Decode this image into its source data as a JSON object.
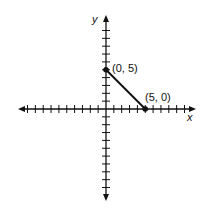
{
  "chart_data": {
    "type": "line",
    "title": "",
    "xlabel": "x",
    "ylabel": "y",
    "xlim": [
      -10,
      11
    ],
    "ylim": [
      -11,
      10
    ],
    "grid": false,
    "tick_interval": 1,
    "series": [
      {
        "name": "segment",
        "x": [
          0,
          5
        ],
        "y": [
          5,
          0
        ]
      }
    ],
    "points": [
      {
        "x": 0,
        "y": 5,
        "label": "(0, 5)"
      },
      {
        "x": 5,
        "y": 0,
        "label": "(5, 0)"
      }
    ]
  },
  "labels": {
    "x_axis": "x",
    "y_axis": "y",
    "point_a": "(0, 5)",
    "point_b": "(5, 0)"
  },
  "colors": {
    "ink": "#111111",
    "background": "#ffffff"
  }
}
